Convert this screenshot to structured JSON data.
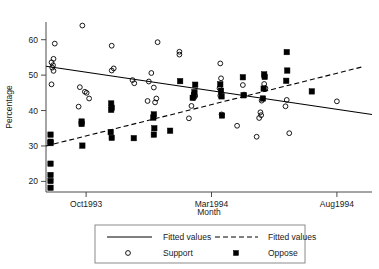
{
  "chart_data": {
    "type": "scatter",
    "title": "",
    "xlabel": "Month",
    "ylabel": "Percentage",
    "grid": false,
    "legend_position": "bottom",
    "ylim": [
      17,
      65
    ],
    "yticks": [
      20,
      30,
      40,
      50,
      60
    ],
    "ytick_labels": [
      "20",
      "30",
      "40",
      "50",
      "60"
    ],
    "xlim": [
      0,
      13
    ],
    "xticks": [
      1.6,
      6.6,
      11.6
    ],
    "xtick_labels": [
      "Oct1993",
      "Mar1994",
      "Aug1994"
    ],
    "series": [
      {
        "name": "Support",
        "marker": "open-circle",
        "color": "#000000",
        "points": [
          [
            0.35,
            58.9
          ],
          [
            0.3,
            54.6
          ],
          [
            0.22,
            53.6
          ],
          [
            0.28,
            52.8
          ],
          [
            0.25,
            52.1
          ],
          [
            0.3,
            51.2
          ],
          [
            0.22,
            47.4
          ],
          [
            1.45,
            64.0
          ],
          [
            1.35,
            46.6
          ],
          [
            1.55,
            45.3
          ],
          [
            1.62,
            45.0
          ],
          [
            1.3,
            41.1
          ],
          [
            1.72,
            43.4
          ],
          [
            2.62,
            58.3
          ],
          [
            2.7,
            51.9
          ],
          [
            2.62,
            51.3
          ],
          [
            3.45,
            48.6
          ],
          [
            3.52,
            47.7
          ],
          [
            4.45,
            59.3
          ],
          [
            4.2,
            50.6
          ],
          [
            4.1,
            48.2
          ],
          [
            4.3,
            46.5
          ],
          [
            4.05,
            42.7
          ],
          [
            4.4,
            43.4
          ],
          [
            4.35,
            42.3
          ],
          [
            5.32,
            56.6
          ],
          [
            5.32,
            55.8
          ],
          [
            5.95,
            44.1
          ],
          [
            5.9,
            43.6
          ],
          [
            5.8,
            41.3
          ],
          [
            5.7,
            37.8
          ],
          [
            6.95,
            53.3
          ],
          [
            6.98,
            49.1
          ],
          [
            6.92,
            46.3
          ],
          [
            6.95,
            44.2
          ],
          [
            7.0,
            38.9
          ],
          [
            7.85,
            47.2
          ],
          [
            7.9,
            44.5
          ],
          [
            7.62,
            35.7
          ],
          [
            8.7,
            47.5
          ],
          [
            8.75,
            46.3
          ],
          [
            8.6,
            42.8
          ],
          [
            8.55,
            39.5
          ],
          [
            8.58,
            38.7
          ],
          [
            8.5,
            37.9
          ],
          [
            8.4,
            32.6
          ],
          [
            9.6,
            43.0
          ],
          [
            9.55,
            41.2
          ],
          [
            9.7,
            33.6
          ],
          [
            11.6,
            42.6
          ]
        ]
      },
      {
        "name": "Oppose",
        "marker": "filled-square",
        "color": "#000000",
        "points": [
          [
            0.18,
            33.2
          ],
          [
            0.18,
            31.2
          ],
          [
            0.18,
            30.8
          ],
          [
            0.18,
            25.0
          ],
          [
            0.18,
            21.8
          ],
          [
            0.18,
            20.1
          ],
          [
            0.18,
            18.2
          ],
          [
            1.42,
            36.9
          ],
          [
            1.42,
            36.2
          ],
          [
            1.45,
            30.1
          ],
          [
            2.6,
            42.0
          ],
          [
            2.62,
            40.8
          ],
          [
            2.6,
            40.2
          ],
          [
            2.58,
            33.9
          ],
          [
            2.62,
            32.3
          ],
          [
            3.5,
            32.2
          ],
          [
            4.3,
            38.9
          ],
          [
            4.28,
            38.0
          ],
          [
            4.32,
            35.0
          ],
          [
            4.3,
            33.2
          ],
          [
            4.95,
            34.3
          ],
          [
            5.35,
            48.3
          ],
          [
            5.95,
            47.3
          ],
          [
            5.92,
            45.2
          ],
          [
            5.9,
            44.4
          ],
          [
            5.85,
            43.6
          ],
          [
            6.95,
            47.4
          ],
          [
            6.98,
            45.6
          ],
          [
            7.0,
            44.0
          ],
          [
            7.02,
            38.6
          ],
          [
            7.85,
            49.4
          ],
          [
            7.88,
            44.3
          ],
          [
            8.7,
            50.2
          ],
          [
            8.72,
            49.5
          ],
          [
            8.68,
            46.2
          ],
          [
            8.65,
            43.4
          ],
          [
            9.6,
            56.5
          ],
          [
            9.62,
            51.3
          ],
          [
            9.58,
            48.4
          ],
          [
            10.6,
            45.4
          ]
        ]
      }
    ],
    "fits": [
      {
        "name": "Fitted values",
        "style": "solid",
        "for_series": "Support",
        "x_start": 0,
        "y_start": 52.5,
        "x_end": 13.0,
        "y_end": 38.9
      },
      {
        "name": "Fitted values",
        "style": "dashed",
        "for_series": "Oppose",
        "x_start": 0,
        "y_start": 30.0,
        "x_end": 12.6,
        "y_end": 52.3
      }
    ],
    "legend_entries": [
      {
        "label": "Fitted values",
        "marker": "solid-line"
      },
      {
        "label": "Fitted values",
        "marker": "dashed-line"
      },
      {
        "label": "Support",
        "marker": "open-circle"
      },
      {
        "label": "Oppose",
        "marker": "filled-square"
      }
    ]
  }
}
